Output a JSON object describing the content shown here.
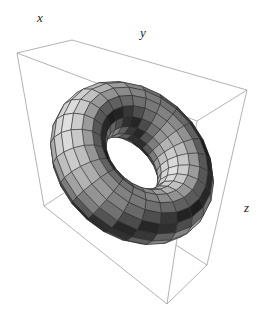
{
  "figure": {
    "type": "3d-surface-plot",
    "surface": "torus",
    "axis_labels": {
      "x": "x",
      "y": "y",
      "z": "z"
    },
    "axis_label_positions": {
      "x": [
        37,
        10
      ],
      "y": [
        140,
        25
      ],
      "z": [
        244,
        200
      ]
    },
    "box_color": "#a0a0a0",
    "mesh_color": "#2a2a2a",
    "torus": {
      "center": [
        132,
        163
      ],
      "major_radius": 62,
      "minor_radius": 28,
      "u_steps": 24,
      "v_steps": 16,
      "tilt_deg": 35,
      "yaw_deg": 30
    },
    "box_edges": [
      [
        [
          17,
          53
        ],
        [
          72,
          40
        ]
      ],
      [
        [
          72,
          40
        ],
        [
          247,
          90
        ]
      ],
      [
        [
          17,
          53
        ],
        [
          197,
          121
        ]
      ],
      [
        [
          197,
          121
        ],
        [
          247,
          90
        ]
      ],
      [
        [
          17,
          53
        ],
        [
          44,
          206
        ]
      ],
      [
        [
          44,
          206
        ],
        [
          167,
          304
        ]
      ],
      [
        [
          167,
          304
        ],
        [
          176,
          245
        ]
      ],
      [
        [
          176,
          245
        ],
        [
          197,
          121
        ]
      ],
      [
        [
          167,
          304
        ],
        [
          207,
          265
        ]
      ],
      [
        [
          207,
          265
        ],
        [
          247,
          90
        ]
      ],
      [
        [
          44,
          206
        ],
        [
          64,
          193
        ]
      ],
      [
        [
          176,
          245
        ],
        [
          207,
          265
        ]
      ]
    ]
  }
}
